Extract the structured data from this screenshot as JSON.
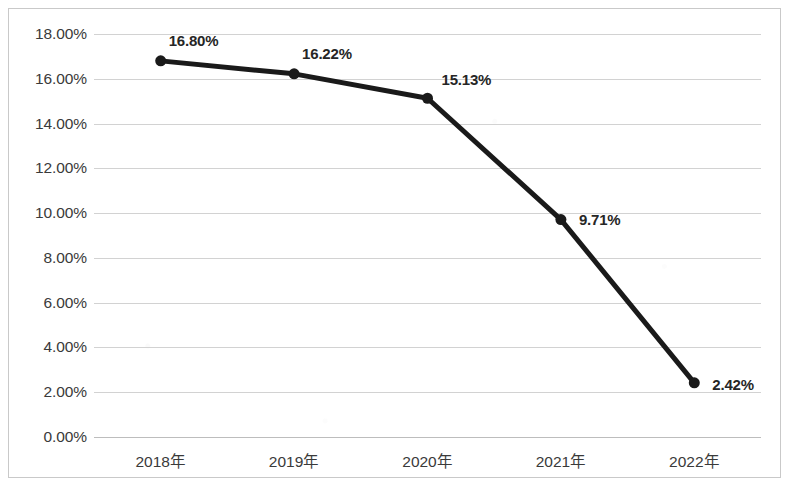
{
  "chart_data": {
    "type": "line",
    "title": "",
    "subtitle": "",
    "xlabel": "",
    "ylabel": "",
    "categories": [
      "2018年",
      "2019年",
      "2020年",
      "2021年",
      "2022年"
    ],
    "values": [
      16.8,
      16.22,
      15.13,
      9.71,
      2.42
    ],
    "data_labels": [
      "16.80%",
      "16.22%",
      "15.13%",
      "9.71%",
      "2.42%"
    ],
    "series": [
      {
        "name": "",
        "values": [
          16.8,
          16.22,
          15.13,
          9.71,
          2.42
        ]
      }
    ],
    "ylim": [
      0,
      18
    ],
    "ytick_step": 2,
    "ytick_labels": [
      "18.00%",
      "16.00%",
      "14.00%",
      "12.00%",
      "10.00%",
      "8.00%",
      "6.00%",
      "4.00%",
      "2.00%",
      "0.00%"
    ],
    "ytick_values": [
      18,
      16,
      14,
      12,
      10,
      8,
      6,
      4,
      2,
      0
    ],
    "grid": true,
    "grid_axis": "y",
    "legend": false,
    "legend_position": "none",
    "marker": "circle",
    "colors": {
      "line": "#1a1a1a",
      "marker": "#1a1a1a",
      "grid": "#d2d2d2",
      "axis": "#bdbdbd",
      "tick_text": "#3a3a3a",
      "data_label_text": "#262626",
      "background": "#ffffff",
      "frame_border": "#c9c9c9"
    },
    "label_offsets": [
      {
        "dx": 8,
        "dy": -20
      },
      {
        "dx": 8,
        "dy": -20
      },
      {
        "dx": 14,
        "dy": -18
      },
      {
        "dx": 18,
        "dy": 0
      },
      {
        "dx": 18,
        "dy": 2
      }
    ]
  }
}
